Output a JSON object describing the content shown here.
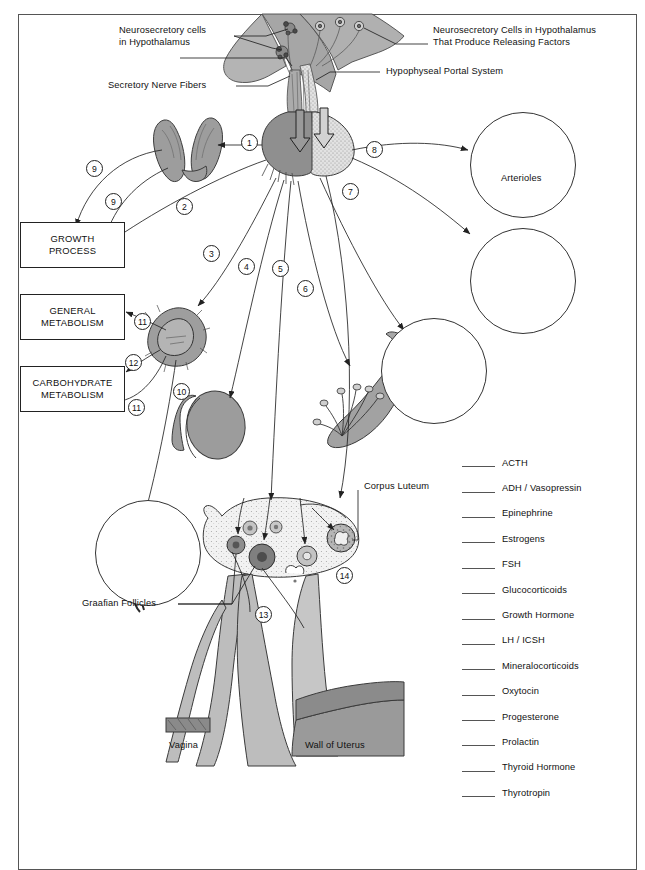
{
  "callouts": [
    {
      "id": "neurosecretory-cells-hypothalamus",
      "text": "Neurosecretory cells\nin Hypothalamus"
    },
    {
      "id": "secretory-nerve-fibers",
      "text": "Secretory Nerve Fibers"
    },
    {
      "id": "neurosecretory-cells-releasing-factors",
      "text": "Neurosecretory Cells in Hypothalamus\nThat Produce Releasing Factors"
    },
    {
      "id": "hypophyseal-portal-system",
      "text": "Hypophyseal Portal System"
    },
    {
      "id": "arterioles",
      "text": "Arterioles"
    },
    {
      "id": "corpus-luteum",
      "text": "Corpus Luteum"
    },
    {
      "id": "graafian-follicles",
      "text": "Graafian Follicles"
    },
    {
      "id": "vagina",
      "text": "Vagina"
    },
    {
      "id": "wall-of-uterus",
      "text": "Wall of Uterus"
    }
  ],
  "process_boxes": [
    {
      "id": "growth-process",
      "line1": "GROWTH",
      "line2": "PROCESS"
    },
    {
      "id": "general-metabolism",
      "line1": "GENERAL",
      "line2": "METABOLISM"
    },
    {
      "id": "carbohydrate-metabolism",
      "line1": "CARBOHYDRATE",
      "line2": "METABOLISM"
    }
  ],
  "pathway_numbers": [
    {
      "n": "1"
    },
    {
      "n": "2"
    },
    {
      "n": "3"
    },
    {
      "n": "4"
    },
    {
      "n": "5"
    },
    {
      "n": "6"
    },
    {
      "n": "7"
    },
    {
      "n": "8"
    },
    {
      "n": "9"
    },
    {
      "n": "9"
    },
    {
      "n": "10"
    },
    {
      "n": "11"
    },
    {
      "n": "11"
    },
    {
      "n": "12"
    },
    {
      "n": "13"
    },
    {
      "n": "14"
    }
  ],
  "legend": {
    "entries": [
      {
        "blank": "",
        "label": "ACTH"
      },
      {
        "blank": "",
        "label": "ADH / Vasopressin"
      },
      {
        "blank": "",
        "label": "Epinephrine"
      },
      {
        "blank": "",
        "label": "Estrogens"
      },
      {
        "blank": "",
        "label": "FSH"
      },
      {
        "blank": "",
        "label": "Glucocorticoids"
      },
      {
        "blank": "",
        "label": "Growth Hormone"
      },
      {
        "blank": "",
        "label": "LH / ICSH"
      },
      {
        "blank": "",
        "label": "Mineralocorticoids"
      },
      {
        "blank": "",
        "label": "Oxytocin"
      },
      {
        "blank": "",
        "label": "Progesterone"
      },
      {
        "blank": "",
        "label": "Prolactin"
      },
      {
        "blank": "",
        "label": "Thyroid Hormone"
      },
      {
        "blank": "",
        "label": "Thyrotropin"
      }
    ]
  },
  "colors": {
    "tissue_fill": "#9a9a9a",
    "tissue_light": "#c9c9c9",
    "tissue_stipple": "#d9d9d9",
    "outline": "#333333",
    "frame": "#555555",
    "text": "#111111"
  }
}
